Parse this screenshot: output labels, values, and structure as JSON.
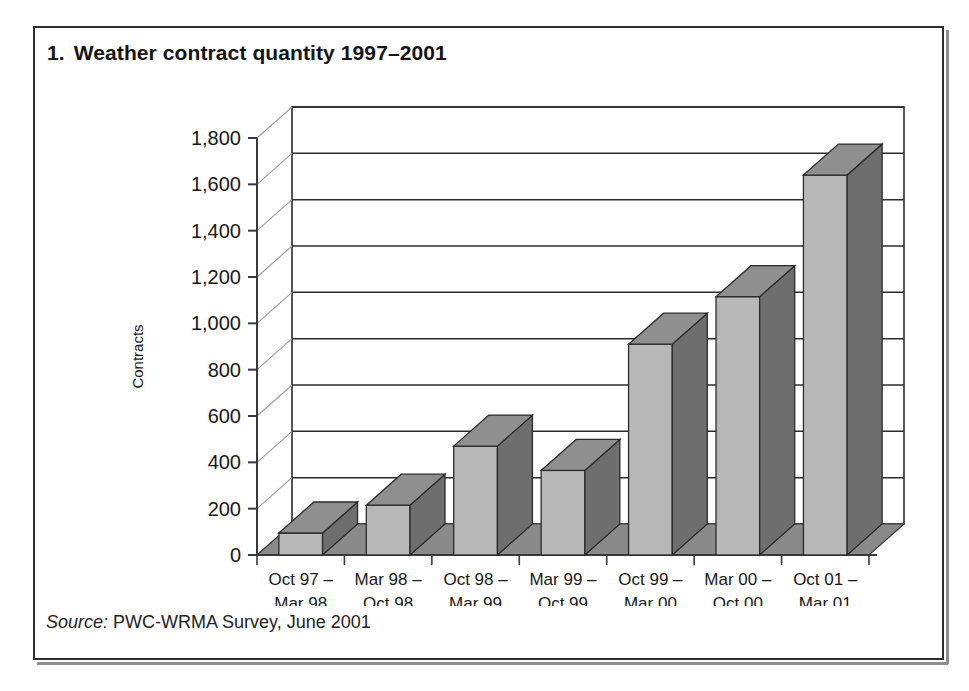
{
  "figure": {
    "number": "1.",
    "title": "Weather contract quantity 1997–2001",
    "source_label": "Source:",
    "source_text": "PWC-WRMA Survey, June 2001"
  },
  "colors": {
    "frame": "#2e2e2e",
    "bar_front": "#b8b8b8",
    "bar_top": "#8f8f8f",
    "bar_side": "#6e6e6e",
    "floor": "#8a8a8a",
    "gridline": "#2b2b2b",
    "text": "#181818",
    "background": "#ffffff"
  },
  "chart_data": {
    "type": "bar",
    "subtitle": "",
    "xlabel": "Period",
    "ylabel": "Contracts",
    "ylim": [
      0,
      1800
    ],
    "ytick_step": 200,
    "ytick_labels": [
      "0",
      "200",
      "400",
      "600",
      "800",
      "1,000",
      "1,200",
      "1,400",
      "1,600",
      "1,800"
    ],
    "ytick_values": [
      0,
      200,
      400,
      600,
      800,
      1000,
      1200,
      1400,
      1600,
      1800
    ],
    "grid": true,
    "legend": "none",
    "three_d": true,
    "categories": [
      "Oct 97 –\nMar 98",
      "Mar 98 –\nOct 98",
      "Oct 98 –\nMar 99",
      "Mar 99 –\nOct 99",
      "Oct 99 –\nMar 00",
      "Mar 00 –\nOct 00",
      "Oct 01 –\nMar 01"
    ],
    "category_lines": [
      [
        "Oct 97 –",
        "Mar 98"
      ],
      [
        "Mar 98 –",
        "Oct 98"
      ],
      [
        "Oct 98 –",
        "Mar 99"
      ],
      [
        "Mar 99 –",
        "Oct 99"
      ],
      [
        "Oct 99 –",
        "Mar 00"
      ],
      [
        "Mar 00 –",
        "Oct 00"
      ],
      [
        "Oct 01 –",
        "Mar 01"
      ]
    ],
    "values": [
      95,
      215,
      470,
      365,
      910,
      1115,
      1640
    ],
    "series": [
      {
        "name": "Contracts",
        "values": [
          95,
          215,
          470,
          365,
          910,
          1115,
          1640
        ]
      }
    ]
  }
}
